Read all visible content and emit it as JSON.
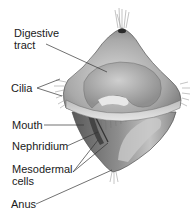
{
  "diagram": {
    "labels": [
      {
        "id": "digestive-tract",
        "lines": [
          "Digestive",
          "tract"
        ]
      },
      {
        "id": "cilia",
        "lines": [
          "Cilia"
        ]
      },
      {
        "id": "mouth",
        "lines": [
          "Mouth"
        ]
      },
      {
        "id": "nephridium",
        "lines": [
          "Nephridium"
        ]
      },
      {
        "id": "mesodermal-cells",
        "lines": [
          "Mesodermal",
          "cells"
        ]
      },
      {
        "id": "anus",
        "lines": [
          "Anus"
        ]
      }
    ],
    "colors": {
      "background": "#ffffff",
      "text": "#1a1a1a",
      "leader_line": "#333333",
      "body_light": "#d9d9d9",
      "body_mid": "#a8a8a8",
      "body_dark": "#5e5e5e",
      "pore": "#2a2a2a"
    }
  }
}
